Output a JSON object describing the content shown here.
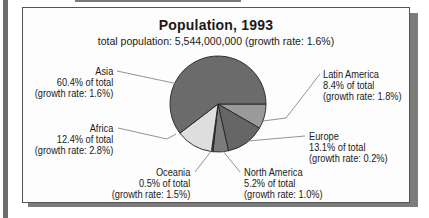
{
  "chart_data": {
    "type": "pie",
    "title": "Population, 1993",
    "subtitle": "total population: 5,544,000,000 (growth rate: 1.6%)",
    "start_angle_deg": 0,
    "direction": "clockwise",
    "slices": [
      {
        "name": "Latin America",
        "percent": 8.4,
        "growth_rate": "1.8%",
        "color": "#9a9a9a"
      },
      {
        "name": "Europe",
        "percent": 13.1,
        "growth_rate": "0.2%",
        "color": "#666666"
      },
      {
        "name": "North America",
        "percent": 5.2,
        "growth_rate": "1.0%",
        "color": "#7b7b7b"
      },
      {
        "name": "Oceania",
        "percent": 0.5,
        "growth_rate": "1.5%",
        "color": "#4a4a4a"
      },
      {
        "name": "Africa",
        "percent": 12.4,
        "growth_rate": "2.8%",
        "color": "#dedede"
      },
      {
        "name": "Asia",
        "percent": 60.4,
        "growth_rate": "1.6%",
        "color": "#6b6b6b"
      }
    ],
    "legend": "none (callout labels with leader lines)"
  },
  "labels": {
    "asia": {
      "name": "Asia",
      "share": "60.4% of total",
      "growth": "(growth rate: 1.6%)"
    },
    "africa": {
      "name": "Africa",
      "share": "12.4% of total",
      "growth": "(growth rate: 2.8%)"
    },
    "oceania": {
      "name": "Oceania",
      "share": "0.5% of total",
      "growth": "(growth rate: 1.5%)"
    },
    "north_america": {
      "name": "North America",
      "share": "5.2% of total",
      "growth": "(growth rate: 1.0%)"
    },
    "europe": {
      "name": "Europe",
      "share": "13.1% of total",
      "growth": "(growth rate: 0.2%)"
    },
    "latin_america": {
      "name": "Latin America",
      "share": "8.4% of total",
      "growth": "(growth rate: 1.8%)"
    }
  }
}
